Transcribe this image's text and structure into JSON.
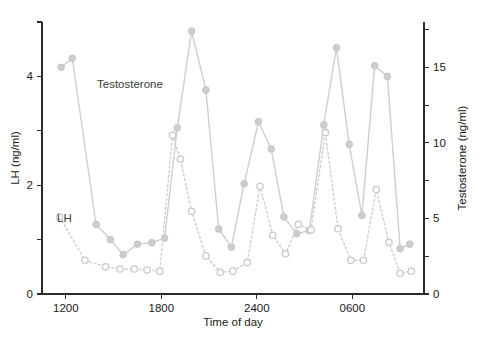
{
  "chart_data": {
    "type": "line",
    "title": "",
    "xlabel": "Time of day",
    "ylabel": "LH (ng/ml)",
    "y2label": "Testosterone (ng/ml)",
    "xlim": [
      10.5,
      34.5
    ],
    "ylim": [
      0,
      5
    ],
    "y2lim": [
      0,
      18
    ],
    "grid": false,
    "legend": "inline-annotations",
    "x_ticks": [
      {
        "value": 12,
        "label": "1200"
      },
      {
        "value": 18,
        "label": "1800"
      },
      {
        "value": 24,
        "label": "2400"
      },
      {
        "value": 30,
        "label": "0600"
      }
    ],
    "y_ticks": [
      {
        "value": 0,
        "label": "0"
      },
      {
        "value": 1,
        "label": ""
      },
      {
        "value": 2,
        "label": "2"
      },
      {
        "value": 3,
        "label": ""
      },
      {
        "value": 4,
        "label": "4"
      },
      {
        "value": 5,
        "label": ""
      }
    ],
    "y2_ticks": [
      {
        "value": 0,
        "label": "0"
      },
      {
        "value": 2.5,
        "label": ""
      },
      {
        "value": 5,
        "label": "5"
      },
      {
        "value": 7.5,
        "label": ""
      },
      {
        "value": 10,
        "label": "10"
      },
      {
        "value": 12.5,
        "label": ""
      },
      {
        "value": 15,
        "label": "15"
      },
      {
        "value": 17.5,
        "label": ""
      }
    ],
    "series": [
      {
        "name": "Testosterone",
        "axis": "right",
        "marker": "filled-circle",
        "linestyle": "solid",
        "color": "#cdcdcd",
        "annotation": "Testosterone",
        "x": [
          11.7,
          12.4,
          13.9,
          14.8,
          15.6,
          16.5,
          17.4,
          18.2,
          19.0,
          19.9,
          20.8,
          21.6,
          22.4,
          23.2,
          24.1,
          24.9,
          25.7,
          26.5,
          27.3,
          28.2,
          29.0,
          29.8,
          30.6,
          31.4,
          32.2,
          33.0,
          33.6
        ],
        "y": [
          15.0,
          15.6,
          4.6,
          3.6,
          2.6,
          3.3,
          3.4,
          3.7,
          11.0,
          17.4,
          13.5,
          4.3,
          3.1,
          7.3,
          11.4,
          9.6,
          5.1,
          4.0,
          4.2,
          11.2,
          16.3,
          9.9,
          5.2,
          15.1,
          14.4,
          3.0,
          3.3
        ]
      },
      {
        "name": "LH",
        "axis": "left",
        "marker": "open-circle",
        "linestyle": "dotted",
        "color": "#cfcfcf",
        "annotation": "LH",
        "x": [
          11.6,
          13.2,
          14.5,
          15.4,
          16.3,
          17.1,
          17.9,
          18.7,
          19.2,
          19.9,
          20.8,
          21.7,
          22.5,
          23.4,
          24.2,
          25.0,
          25.8,
          26.6,
          27.4,
          28.3,
          29.1,
          29.9,
          30.7,
          31.5,
          32.3,
          33.0,
          33.7
        ],
        "y": [
          1.42,
          0.62,
          0.5,
          0.46,
          0.46,
          0.44,
          0.42,
          2.92,
          2.48,
          1.52,
          0.7,
          0.4,
          0.42,
          0.58,
          1.98,
          1.08,
          0.74,
          1.28,
          1.18,
          2.97,
          1.2,
          0.62,
          0.62,
          1.92,
          0.95,
          0.38,
          0.42
        ]
      }
    ]
  },
  "annotations": {
    "testosterone_label": "Testosterone",
    "lh_label": "LH"
  },
  "colors": {
    "series": "#cdcdcd",
    "axis": "#2b2b2b",
    "text": "#1a1a1a",
    "background": "#ffffff"
  }
}
